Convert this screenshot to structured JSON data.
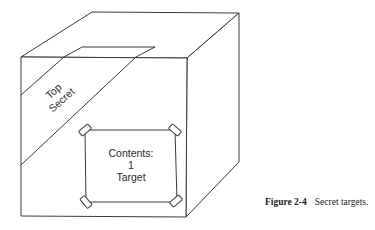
{
  "figure": {
    "number_label": "Figure 2-4",
    "caption_text": "Secret targets."
  },
  "box": {
    "tape_label": {
      "line1": "Top",
      "line2": "Secret"
    },
    "shipping_label": {
      "line1": "Contents:",
      "line2": "1",
      "line3": "Target"
    }
  },
  "colors": {
    "line": "#3a3a3a",
    "background": "#ffffff"
  }
}
